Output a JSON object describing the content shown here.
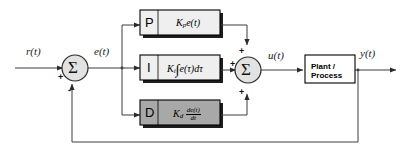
{
  "diagram": {
    "colors": {
      "line": "#3d3d3d",
      "block_border": "#000000",
      "p_fill": "#efefef",
      "i_fill": "#efefef",
      "d_fill": "#a8a8a8",
      "plant_fill": "#ffffff",
      "sum_fill": "#e2e2e2",
      "shadow": "#1a1a1a",
      "text": "#000000"
    },
    "signals": {
      "reference": "r(t)",
      "error": "e(t)",
      "control": "u(t)",
      "output": "y(t)"
    },
    "sum_left": {
      "symbol": "Σ",
      "input_sign": "+",
      "feedback_sign": "-"
    },
    "sum_right": {
      "symbol": "Σ",
      "sign_top": "+",
      "sign_left": "+",
      "sign_bottom": "+"
    },
    "blocks": [
      {
        "key": "proportional",
        "letter": "P",
        "gain_symbol": "K",
        "gain_subscript": "p",
        "formula_tail": "e(t)",
        "formula_plain": "Kₙe(t)"
      },
      {
        "key": "integral",
        "letter": "I",
        "gain_symbol": "K",
        "gain_subscript": "i",
        "integral_glyph": "∫",
        "formula_tail": "e(τ)dτ",
        "formula_plain": "Kᵢ∫e(τ)dτ"
      },
      {
        "key": "derivative",
        "letter": "D",
        "gain_symbol": "K",
        "gain_subscript": "d",
        "fraction_numerator": "de(t)",
        "fraction_denominator": "dt",
        "formula_plain": "Kₔ de(t)/dt"
      }
    ],
    "plant": {
      "line1": "Plant /",
      "line2": "Process"
    }
  }
}
